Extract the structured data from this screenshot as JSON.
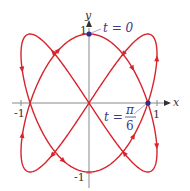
{
  "figure": {
    "curve": {
      "x_expr": "sin 2t",
      "y_expr": "cos 3t",
      "t_range": [
        0,
        6.2832
      ],
      "color": "#d8242c"
    },
    "axes": {
      "x_label": "x",
      "y_label": "y",
      "ticks": {
        "x_pos": "1",
        "x_neg": "-1",
        "y_pos": "1",
        "y_neg": "-1"
      },
      "color": "#777777"
    },
    "points": [
      {
        "label_t": "t = 0",
        "x": 0,
        "y": 1,
        "color": "#2a2f8c"
      },
      {
        "label_t": "t =",
        "label_num": "π",
        "label_den": "6",
        "x": 0.866,
        "y": 0,
        "color": "#2a2f8c"
      }
    ]
  }
}
